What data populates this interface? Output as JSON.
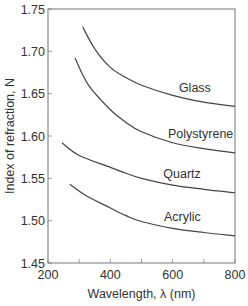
{
  "chart_data": {
    "type": "line",
    "title": "",
    "xlabel": "Wavelength, λ (nm)",
    "ylabel": "Index of refraction, N",
    "xlim": [
      200,
      800
    ],
    "ylim": [
      1.45,
      1.75
    ],
    "xticks": [
      200,
      400,
      600,
      800
    ],
    "xticks_minor": [
      300,
      500,
      700
    ],
    "yticks": [
      1.45,
      1.5,
      1.55,
      1.6,
      1.65,
      1.7,
      1.75
    ],
    "ytick_labels": [
      "1.45",
      "1.50",
      "1.55",
      "1.60",
      "1.65",
      "1.70",
      "1.75"
    ],
    "xtick_labels": [
      "200",
      "400",
      "600",
      "800"
    ],
    "grid": false,
    "legend": "inline labels near right end of each curve",
    "series": [
      {
        "name": "Glass",
        "x": [
          311,
          350,
          400,
          450,
          500,
          600,
          700,
          800
        ],
        "y": [
          1.729,
          1.703,
          1.681,
          1.669,
          1.66,
          1.648,
          1.64,
          1.635
        ]
      },
      {
        "name": "Polystyrene",
        "x": [
          287,
          330,
          400,
          450,
          500,
          600,
          700,
          800
        ],
        "y": [
          1.692,
          1.66,
          1.631,
          1.616,
          1.605,
          1.592,
          1.585,
          1.58
        ]
      },
      {
        "name": "Quartz",
        "x": [
          245,
          300,
          400,
          450,
          500,
          600,
          700,
          800
        ],
        "y": [
          1.592,
          1.577,
          1.563,
          1.556,
          1.55,
          1.542,
          1.537,
          1.533
        ]
      },
      {
        "name": "Acrylic",
        "x": [
          270,
          320,
          400,
          450,
          500,
          600,
          700,
          800
        ],
        "y": [
          1.543,
          1.53,
          1.515,
          1.506,
          1.499,
          1.491,
          1.486,
          1.482
        ]
      }
    ],
    "label_positions": {
      "Glass": [
        620,
        1.652
      ],
      "Polystyrene": [
        585,
        1.598
      ],
      "Quartz": [
        570,
        1.55
      ],
      "Acrylic": [
        572,
        1.5
      ]
    },
    "colors": {
      "curve": "#444444",
      "frame": "#777777",
      "text": "#333333",
      "background": "#ffffff"
    }
  }
}
